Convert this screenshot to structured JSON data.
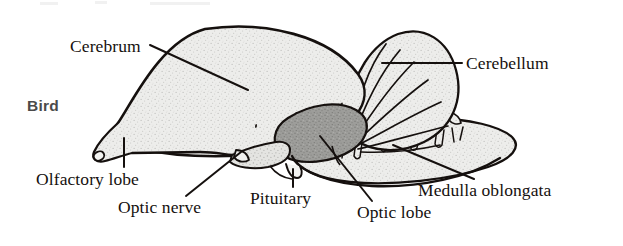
{
  "figure": {
    "taxon_label": "Bird",
    "background_color": "#ffffff",
    "ink_color": "#15100e",
    "taxon_color": "#4a4a4a",
    "fill_light_gray": "#e9e9e7",
    "fill_mid_gray": "#9a9a9a",
    "stipple": true
  },
  "labels": {
    "cerebrum": "Cerebrum",
    "cerebellum": "Cerebellum",
    "olfactory_lobe": "Olfactory lobe",
    "optic_nerve": "Optic nerve",
    "pituitary": "Pituitary",
    "optic_lobe": "Optic lobe",
    "medulla_oblongata": "Medulla oblongata"
  },
  "structures": [
    {
      "name": "cerebrum",
      "label": "Cerebrum",
      "shading": "light-stipple"
    },
    {
      "name": "cerebellum",
      "label": "Cerebellum",
      "shading": "light-stipple",
      "detail": "radiating folia"
    },
    {
      "name": "olfactory-lobe",
      "label": "Olfactory lobe",
      "shading": "light-stipple"
    },
    {
      "name": "optic-nerve",
      "label": "Optic nerve",
      "shading": "light-stipple"
    },
    {
      "name": "pituitary",
      "label": "Pituitary",
      "shading": "light-stipple"
    },
    {
      "name": "optic-lobe",
      "label": "Optic lobe",
      "shading": "mid-gray"
    },
    {
      "name": "medulla-oblongata",
      "label": "Medulla oblongata",
      "shading": "light-stipple",
      "detail": "cranial nerve rootlets"
    }
  ],
  "leader_lines": [
    {
      "for": "cerebrum",
      "from": [
        150,
        45
      ],
      "to": [
        248,
        90
      ]
    },
    {
      "for": "cerebellum",
      "from": [
        462,
        63
      ],
      "to": [
        382,
        63
      ]
    },
    {
      "for": "olfactory-lobe",
      "from": [
        124,
        166
      ],
      "to": [
        124,
        140
      ]
    },
    {
      "for": "optic-nerve",
      "from": [
        186,
        196
      ],
      "to": [
        240,
        152
      ]
    },
    {
      "for": "pituitary",
      "from": [
        293,
        186
      ],
      "to": [
        293,
        168
      ]
    },
    {
      "for": "optic-lobe",
      "from": [
        372,
        200
      ],
      "to": [
        322,
        137
      ]
    },
    {
      "for": "medulla-oblongata",
      "from": [
        474,
        178
      ],
      "to": [
        394,
        146
      ]
    }
  ]
}
